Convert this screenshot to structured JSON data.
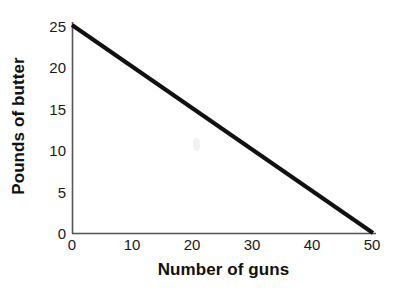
{
  "figure": {
    "background_color": "#ffffff",
    "ink_color": "#111111"
  },
  "chart_data": {
    "type": "line",
    "title": "",
    "subtitle": "",
    "xlabel": "Number of guns",
    "ylabel": "Pounds of butter",
    "xlim": [
      0,
      50
    ],
    "ylim": [
      0,
      25
    ],
    "xticks": [
      0,
      10,
      20,
      30,
      40,
      50
    ],
    "yticks": [
      0,
      5,
      10,
      15,
      20,
      25
    ],
    "xtick_labels": [
      "0",
      "10",
      "20",
      "30",
      "40",
      "50"
    ],
    "ytick_labels": [
      "0",
      "5",
      "10",
      "15",
      "20",
      "25"
    ],
    "grid": false,
    "legend": null,
    "annotations": [],
    "series": [
      {
        "name": "Production possibilities frontier",
        "color": "#111111",
        "line_width": 4,
        "x": [
          0,
          50
        ],
        "values": [
          25,
          0
        ],
        "points": [
          {
            "x": 0,
            "y": 25
          },
          {
            "x": 50,
            "y": 0
          }
        ]
      }
    ]
  }
}
